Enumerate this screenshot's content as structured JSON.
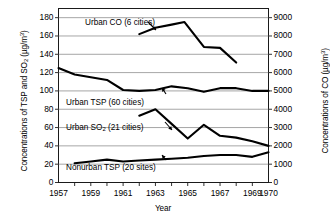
{
  "chart_data": {
    "type": "line",
    "title": "",
    "xlabel": "Year",
    "ylabel_left": "Concentrations of TSP and SO2 (µg/m3)",
    "ylabel_right": "Concentrations of CO (µg/m3)",
    "xlim": [
      1957,
      1970
    ],
    "ylim_left": [
      0,
      190
    ],
    "ylim_right": [
      0,
      9500
    ],
    "grid": true,
    "grid_lines_left": [
      20,
      40,
      60,
      80,
      100,
      120,
      140,
      160,
      180
    ],
    "legend": "inline-annotations",
    "xticks": [
      1957,
      1959,
      1961,
      1963,
      1965,
      1967,
      1969,
      1970
    ],
    "xtick_labels": [
      "1957",
      "1959",
      "1961",
      "1963",
      "1965",
      "1967",
      "1969",
      "1970"
    ],
    "xticks_minor": [
      1958,
      1960,
      1962,
      1964,
      1966,
      1968
    ],
    "yticks_left": [
      0,
      20,
      40,
      60,
      80,
      100,
      120,
      140,
      160,
      180
    ],
    "ytick_labels_left": [
      "0",
      "20",
      "40",
      "60",
      "80",
      "100",
      "120",
      "140",
      "160",
      "180"
    ],
    "yticks_right": [
      0,
      1000,
      2000,
      3000,
      4000,
      5000,
      6000,
      7000,
      8000,
      9000
    ],
    "ytick_labels_right": [
      "0",
      "1000",
      "2000",
      "3000",
      "4000",
      "5000",
      "6000",
      "7000",
      "8000",
      "9000"
    ],
    "series": [
      {
        "name": "Urban CO (6 cities)",
        "axis": "right",
        "unit": "µg/m3",
        "color": "#000000",
        "x": [
          1962,
          1963,
          1964,
          1964.8,
          1966,
          1967,
          1968
        ],
        "values": [
          8100,
          8450,
          8620,
          8760,
          7400,
          7350,
          6550
        ]
      },
      {
        "name": "Urban TSP (60 cities)",
        "axis": "left",
        "unit": "µg/m3",
        "color": "#000000",
        "x": [
          1957,
          1958,
          1959,
          1960,
          1961,
          1962,
          1963,
          1964,
          1965,
          1966,
          1967,
          1968,
          1969,
          1970
        ],
        "values": [
          125,
          118,
          115,
          112,
          101,
          100,
          101,
          105,
          103,
          99,
          103,
          103,
          100,
          100
        ]
      },
      {
        "name": "Urban SO2 (21 cities)",
        "axis": "left",
        "unit": "µg/m3",
        "color": "#000000",
        "x": [
          1962,
          1963,
          1964,
          1965,
          1966,
          1967,
          1968,
          1969,
          1970
        ],
        "values": [
          73,
          80,
          64,
          48,
          63,
          51,
          49,
          45,
          40
        ]
      },
      {
        "name": "Nonurban TSP (20 sites)",
        "axis": "left",
        "unit": "µg/m3",
        "color": "#000000",
        "x": [
          1958,
          1959,
          1960,
          1961,
          1962,
          1963,
          1964,
          1965,
          1966,
          1967,
          1968,
          1969,
          1970
        ],
        "values": [
          21,
          23,
          25,
          23,
          24,
          25,
          26,
          27,
          29,
          30,
          30,
          28,
          33
        ]
      }
    ],
    "annotations": [
      {
        "label": "Urban CO (6 cities)",
        "points_to": "urban-co-series"
      },
      {
        "label": "Urban TSP (60 cities)",
        "points_to": "urban-tsp-series"
      },
      {
        "label": "Urban SO2 (21 cities)",
        "points_to": "urban-so2-series"
      },
      {
        "label": "Nonurban TSP (20 sites)",
        "points_to": "nonurban-tsp-series"
      }
    ]
  },
  "axes": {
    "xlabel": "Year",
    "left_title_pre": "Concentrations of TSP and SO",
    "left_title_sub": "2",
    "left_title_mid": " (µg/m",
    "left_title_sup": "3",
    "left_title_post": ")",
    "right_title_pre": "Concentrations of CO (µg/m",
    "right_title_sup": "3",
    "right_title_post": ")"
  },
  "labels": {
    "urban_co": "Urban CO (6 cities)",
    "urban_tsp": "Urban TSP (60 cities)",
    "urban_so2_pre": "Urban SO",
    "urban_so2_sub": "2",
    "urban_so2_post": " (21 cities)",
    "nonurban_tsp": "Nonurban TSP (20 sites)"
  }
}
